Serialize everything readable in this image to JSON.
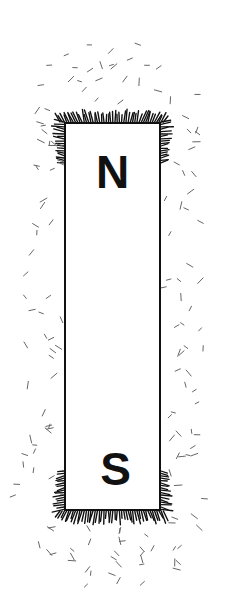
{
  "diagram": {
    "north_label": "N",
    "south_label": "S",
    "colors": {
      "ink": "#111111",
      "filings": "#555555",
      "background": "#ffffff"
    }
  }
}
